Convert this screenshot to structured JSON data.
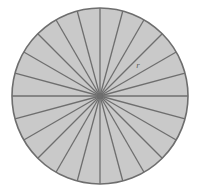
{
  "figure": {
    "name": "circle-divided-into-equal-sectors",
    "background_color": "#ffffff"
  },
  "chart_data": {
    "type": "pie",
    "title": "",
    "subtitle": "",
    "xlabel": "",
    "ylabel": "",
    "legend_position": "none",
    "grid": false,
    "sector_count": 24,
    "sector_angle_degrees": 15,
    "equal_slices": true,
    "categories": [
      "1",
      "2",
      "3",
      "4",
      "5",
      "6",
      "7",
      "8",
      "9",
      "10",
      "11",
      "12",
      "13",
      "14",
      "15",
      "16",
      "17",
      "18",
      "19",
      "20",
      "21",
      "22",
      "23",
      "24"
    ],
    "values": [
      15,
      15,
      15,
      15,
      15,
      15,
      15,
      15,
      15,
      15,
      15,
      15,
      15,
      15,
      15,
      15,
      15,
      15,
      15,
      15,
      15,
      15,
      15,
      15
    ],
    "start_angle_degrees": -90,
    "geometry": {
      "center_x": 100,
      "center_y": 96,
      "radius": 88,
      "bounds": {
        "left": 12,
        "top": 8,
        "right": 188,
        "bottom": 184
      }
    },
    "style": {
      "fill_color": "#c9c9c9",
      "stroke_color": "#6e6e6e",
      "outline_color": "#6e6e6e",
      "stroke_width": 1.3,
      "outline_width": 1.6
    }
  },
  "annotations": {
    "radius_label": {
      "text": "r",
      "x": 138,
      "y": 68,
      "color": "#5e5e5e",
      "font_size": 9
    }
  }
}
